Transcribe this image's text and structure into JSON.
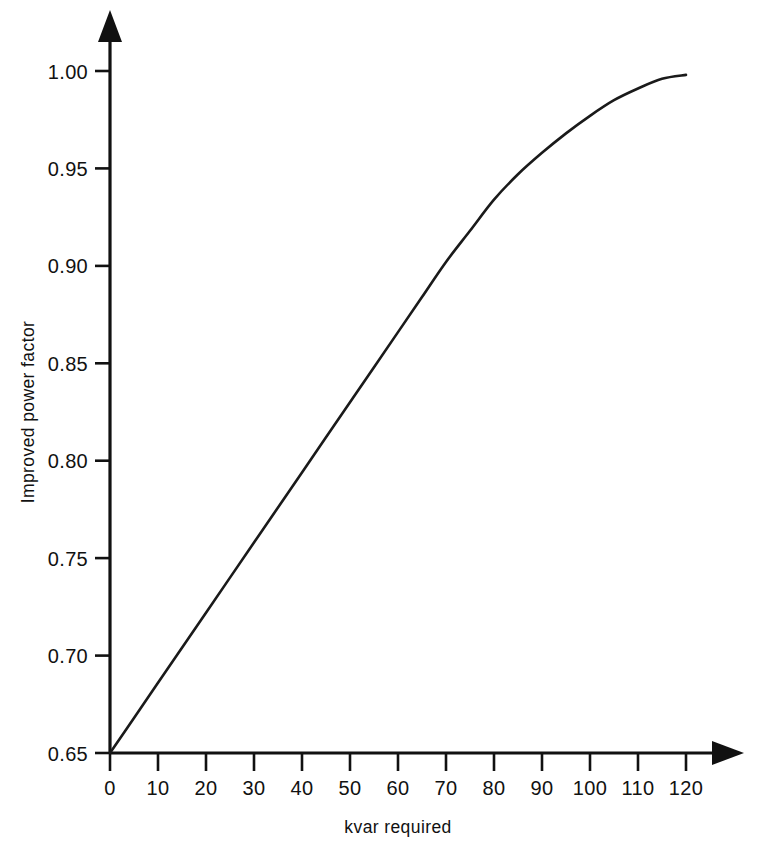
{
  "chart_data": {
    "type": "line",
    "title": "",
    "subtitle": "",
    "xlabel": "kvar required",
    "ylabel": "Improved power factor",
    "xlim": [
      0,
      120
    ],
    "ylim": [
      0.65,
      1.0
    ],
    "grid": false,
    "legend": null,
    "legend_position": "none",
    "xticks": [
      0,
      10,
      20,
      30,
      40,
      50,
      60,
      70,
      80,
      90,
      100,
      110,
      120
    ],
    "xtick_labels": [
      "0",
      "10",
      "20",
      "30",
      "40",
      "50",
      "60",
      "70",
      "80",
      "90",
      "100",
      "110",
      "120"
    ],
    "yticks": [
      0.65,
      0.7,
      0.75,
      0.8,
      0.85,
      0.9,
      0.95,
      1.0
    ],
    "ytick_labels": [
      "0.65",
      "0.70",
      "0.75",
      "0.80",
      "0.85",
      "0.90",
      "0.95",
      "1.00"
    ],
    "axis_arrows": true,
    "line_color": "#1a1a1a",
    "background_color": "#ffffff",
    "series": [
      {
        "name": "Improved power factor vs kvar required",
        "x": [
          0,
          5,
          10,
          15,
          20,
          25,
          30,
          35,
          40,
          45,
          50,
          55,
          60,
          65,
          70,
          75,
          80,
          85,
          90,
          95,
          100,
          105,
          110,
          115,
          120
        ],
        "values": [
          0.65,
          0.668,
          0.686,
          0.704,
          0.722,
          0.74,
          0.758,
          0.776,
          0.794,
          0.812,
          0.83,
          0.848,
          0.866,
          0.884,
          0.902,
          0.918,
          0.934,
          0.947,
          0.958,
          0.968,
          0.977,
          0.985,
          0.991,
          0.996,
          0.998
        ]
      }
    ],
    "annotations": []
  },
  "axes": {
    "y_axis_title": "Improved power factor",
    "x_axis_title": "kvar required"
  }
}
